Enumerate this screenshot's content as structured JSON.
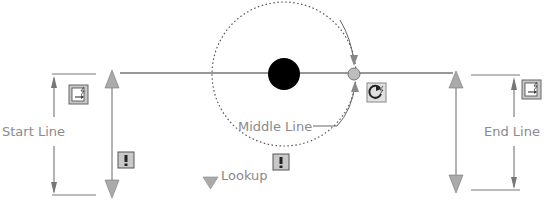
{
  "labels": {
    "start_line": "Start Line",
    "middle_line": "Middle Line",
    "end_line": "End Line",
    "lookup": "Lookup"
  },
  "icons": {
    "start_edit": "edit-parameter-icon",
    "end_edit": "edit-parameter-icon",
    "rotate": "rotation-action-icon",
    "warn_left": "warning-icon",
    "warn_mid": "warning-icon",
    "lookup_grip": "lookup-grip-icon"
  },
  "colors": {
    "line": "#333333",
    "dim": "#6a6a6a",
    "grip": "#a8a8a8",
    "center_dot": "#000000",
    "text": "#8a8a8a"
  }
}
